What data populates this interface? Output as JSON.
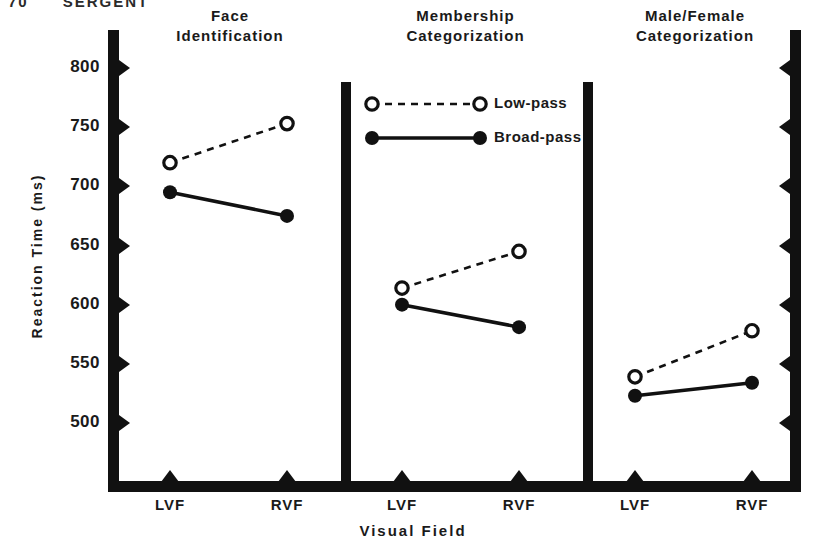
{
  "runhead": {
    "page_number": "70",
    "author": "SERGENT"
  },
  "chart_data": {
    "type": "line",
    "title": "",
    "xlabel": "Visual Field",
    "ylabel": "Reaction Time (ms)",
    "ylim": [
      475,
      820
    ],
    "yticks": [
      800,
      750,
      700,
      650,
      600,
      550,
      500
    ],
    "ytick_labels": [
      "800",
      "750",
      "700",
      "650",
      "600",
      "550",
      "500"
    ],
    "x": [
      "LVF",
      "RVF"
    ],
    "grid": false,
    "legend_position": "panel-2-top",
    "legend": [
      {
        "name": "Low-pass",
        "marker": "open-circle",
        "line": "dashed"
      },
      {
        "name": "Broad-pass",
        "marker": "filled-circle",
        "line": "solid"
      }
    ],
    "panels": [
      {
        "title_line1": "Face",
        "title_line2": "Identification",
        "categories": [
          "LVF",
          "RVF"
        ],
        "series": [
          {
            "name": "Low-pass",
            "values": [
              720,
              753
            ]
          },
          {
            "name": "Broad-pass",
            "values": [
              695,
              675
            ]
          }
        ]
      },
      {
        "title_line1": "Membership",
        "title_line2": "Categorization",
        "categories": [
          "LVF",
          "RVF"
        ],
        "series": [
          {
            "name": "Low-pass",
            "values": [
              614,
              645
            ]
          },
          {
            "name": "Broad-pass",
            "values": [
              600,
              581
            ]
          }
        ]
      },
      {
        "title_line1": "Male/Female",
        "title_line2": "Categorization",
        "categories": [
          "LVF",
          "RVF"
        ],
        "series": [
          {
            "name": "Low-pass",
            "values": [
              539,
              578
            ]
          },
          {
            "name": "Broad-pass",
            "values": [
              523,
              534
            ]
          }
        ]
      }
    ]
  },
  "colors": {
    "ink": "#111111",
    "paper": "#ffffff"
  }
}
